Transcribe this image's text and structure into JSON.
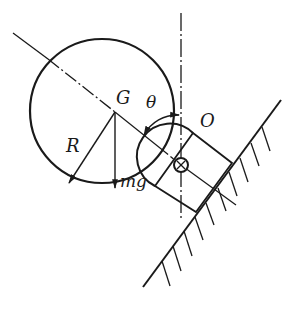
{
  "diagram": {
    "type": "mechanics-free-body",
    "labels": {
      "center_of_mass": "G",
      "angle": "θ",
      "pivot": "O",
      "radius": "R",
      "weight": "mg"
    },
    "colors": {
      "stroke": "#1a1a1a",
      "background": "#ffffff"
    }
  }
}
